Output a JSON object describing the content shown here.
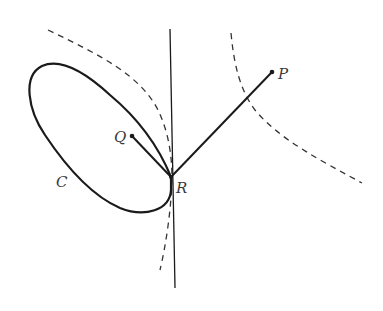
{
  "diagram": {
    "labels": {
      "P": "P",
      "Q": "Q",
      "R": "R",
      "C": "C"
    },
    "elements": {
      "curve_C": "closed oval curve",
      "tangent_line": "vertical line through R",
      "segment_QR": "Q to R",
      "segment_RP": "R to P",
      "dashed_left": "dashed level curve tangent at R",
      "dashed_right": "dashed level curve through segment RP"
    },
    "colors": {
      "stroke": "#1a1a1a",
      "dashed": "#333333",
      "label": "#3a3a3a"
    }
  }
}
